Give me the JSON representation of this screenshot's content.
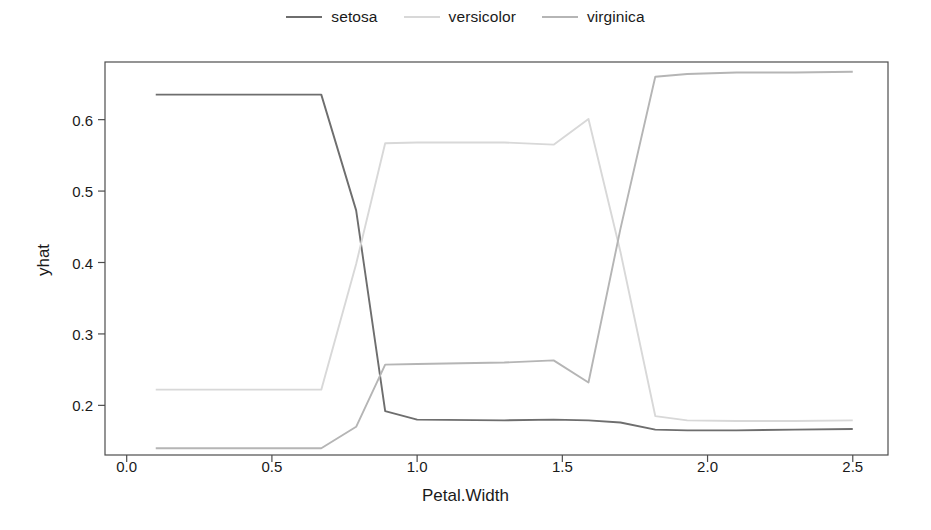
{
  "chart_data": {
    "type": "line",
    "title": "",
    "subtitle": "",
    "xlabel": "Petal.Width",
    "ylabel": "yhat",
    "xlim": [
      -0.0747,
      2.6213
    ],
    "ylim": [
      0.1305,
      0.6807
    ],
    "xticks": [
      "0.0",
      "0.5",
      "1.0",
      "1.5",
      "2.0",
      "2.5"
    ],
    "xtick_values": [
      0.0,
      0.5,
      1.0,
      1.5,
      2.0,
      2.5
    ],
    "yticks": [
      "0.2",
      "0.3",
      "0.4",
      "0.5",
      "0.6"
    ],
    "ytick_values": [
      0.2,
      0.3,
      0.4,
      0.5,
      0.6
    ],
    "grid": false,
    "legend_position": "top-center",
    "box": true,
    "series": [
      {
        "name": "setosa",
        "color": "#6e6e6e",
        "x": [
          0.1,
          0.67,
          0.79,
          0.89,
          1.0,
          1.3,
          1.47,
          1.59,
          1.7,
          1.82,
          1.93,
          2.1,
          2.3,
          2.5
        ],
        "y": [
          0.635,
          0.635,
          0.473,
          0.192,
          0.18,
          0.179,
          0.18,
          0.179,
          0.176,
          0.166,
          0.165,
          0.165,
          0.166,
          0.167
        ]
      },
      {
        "name": "versicolor",
        "color": "#d8d8d8",
        "x": [
          0.1,
          0.67,
          0.79,
          0.89,
          1.0,
          1.3,
          1.47,
          1.59,
          1.7,
          1.82,
          1.93,
          2.1,
          2.3,
          2.5
        ],
        "y": [
          0.222,
          0.222,
          0.398,
          0.567,
          0.568,
          0.568,
          0.565,
          0.601,
          0.415,
          0.185,
          0.179,
          0.178,
          0.178,
          0.179
        ]
      },
      {
        "name": "virginica",
        "color": "#b5b5b5",
        "x": [
          0.1,
          0.67,
          0.79,
          0.89,
          1.0,
          1.3,
          1.47,
          1.59,
          1.7,
          1.82,
          1.93,
          2.1,
          2.3,
          2.5
        ],
        "y": [
          0.14,
          0.14,
          0.17,
          0.257,
          0.258,
          0.26,
          0.263,
          0.232,
          0.447,
          0.66,
          0.664,
          0.666,
          0.666,
          0.667
        ]
      }
    ]
  },
  "legend": {
    "entries": [
      {
        "label": "setosa",
        "color": "#6e6e6e"
      },
      {
        "label": "versicolor",
        "color": "#d8d8d8"
      },
      {
        "label": "virginica",
        "color": "#b5b5b5"
      }
    ]
  },
  "axes": {
    "x_title": "Petal.Width",
    "y_title": "yhat",
    "x_tick_labels": [
      "0.0",
      "0.5",
      "1.0",
      "1.5",
      "2.0",
      "2.5"
    ],
    "y_tick_labels": [
      "0.2",
      "0.3",
      "0.4",
      "0.5",
      "0.6"
    ]
  },
  "style": {
    "background": "#ffffff",
    "axis_color": "#4d4d4d",
    "text_color": "#1a1a1a"
  }
}
